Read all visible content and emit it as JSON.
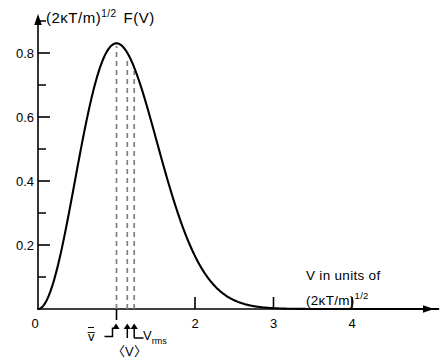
{
  "figure": {
    "background": "#ffffff",
    "ink": "#000000",
    "guide_color": "#8a8a8a"
  },
  "axes": {
    "y_title_parts": {
      "base": "(2κT/m)",
      "exponent": "1/2",
      "func": "F(V)"
    },
    "x_caption_line1": "V in units of",
    "x_caption_line2_base": "(2κT/m)",
    "x_caption_line2_exp": "1/2",
    "y_ticks": [
      "0.2",
      "0.4",
      "0.6",
      "0.8"
    ],
    "y_tick_values": [
      0.2,
      0.4,
      0.6,
      0.8
    ],
    "y_minor_values": [
      0.1,
      0.3,
      0.5,
      0.7,
      0.9
    ],
    "x_ticks": [
      "2",
      "3",
      "4"
    ],
    "x_tick_values": [
      2,
      3,
      4
    ],
    "x_unlabeled_ticks": [
      1
    ],
    "origin_label": "0",
    "xlim": [
      0,
      5.1
    ],
    "ylim": [
      0,
      0.95
    ]
  },
  "annotations": {
    "most_probable": {
      "label": "v̅",
      "value": 1.0
    },
    "mean": {
      "label": "〈V〉",
      "value": 1.128
    },
    "rms": {
      "label_base": "V",
      "label_sub": "rms",
      "value": 1.225
    }
  },
  "chart_data": {
    "type": "line",
    "title": "",
    "xlabel": "V in units of (2κT/m)^1/2",
    "ylabel": "(2κT/m)^1/2 F(V)",
    "xlim": [
      0,
      5.1
    ],
    "ylim": [
      0,
      0.95
    ],
    "grid": false,
    "legend": null,
    "series": [
      {
        "name": "Maxwell-Boltzmann speed distribution",
        "formula": "F(V) = (4/sqrt(pi)) * V^2 * exp(-V^2)",
        "x": [
          0.0,
          0.1,
          0.2,
          0.3,
          0.4,
          0.5,
          0.6,
          0.7,
          0.8,
          0.9,
          1.0,
          1.1,
          1.2,
          1.3,
          1.4,
          1.5,
          1.6,
          1.7,
          1.8,
          1.9,
          2.0,
          2.1,
          2.2,
          2.3,
          2.4,
          2.5,
          2.6,
          2.7,
          2.8,
          2.9,
          3.0,
          3.2,
          3.4,
          3.6,
          3.8,
          4.0,
          4.5,
          5.0
        ],
        "y": [
          0.0,
          0.022,
          0.087,
          0.188,
          0.308,
          0.439,
          0.566,
          0.677,
          0.762,
          0.814,
          0.83,
          0.813,
          0.765,
          0.694,
          0.609,
          0.518,
          0.427,
          0.343,
          0.268,
          0.204,
          0.151,
          0.109,
          0.077,
          0.053,
          0.036,
          0.023,
          0.015,
          0.009,
          0.006,
          0.003,
          0.002,
          0.001,
          0.0,
          0.0,
          0.0,
          0.0,
          0.0,
          0.0
        ]
      }
    ],
    "markers": [
      {
        "name": "v_bar (most probable speed)",
        "x": 1.0,
        "y_top": 0.83,
        "style": "dashed-vertical"
      },
      {
        "name": "<V> (mean speed)",
        "x": 1.128,
        "y_top": 0.796,
        "style": "dashed-vertical"
      },
      {
        "name": "V_rms (root-mean-square speed)",
        "x": 1.225,
        "y_top": 0.753,
        "style": "dashed-vertical"
      }
    ],
    "peak": {
      "x": 1.0,
      "y": 0.83
    }
  }
}
